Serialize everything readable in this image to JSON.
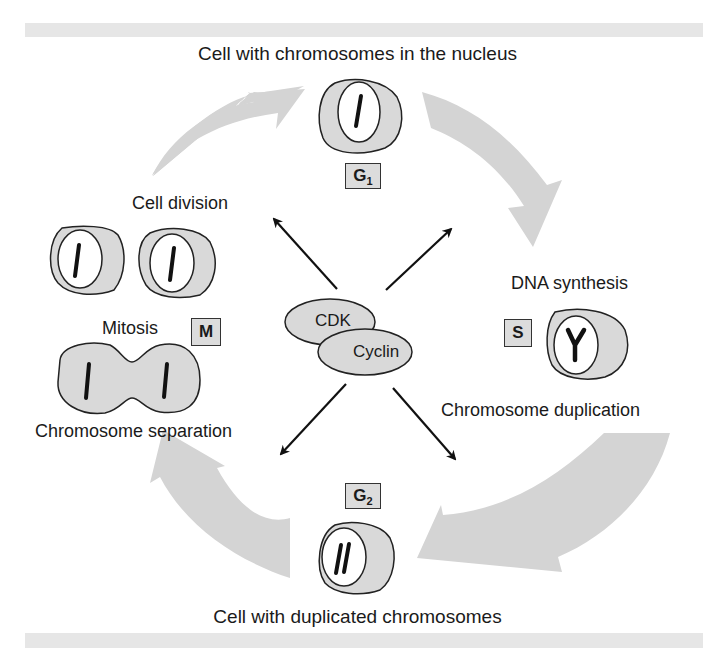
{
  "title": "Cell with chromosomes in the nucleus",
  "footer": "Cell with duplicated chromosomes",
  "labels": {
    "cell_division": "Cell division",
    "mitosis": "Mitosis",
    "chromosome_separation": "Chromosome separation",
    "dna_synthesis": "DNA synthesis",
    "chromosome_duplication": "Chromosome duplication"
  },
  "phases": {
    "g1": {
      "letter": "G",
      "sub": "1"
    },
    "s": {
      "letter": "S",
      "sub": ""
    },
    "g2": {
      "letter": "G",
      "sub": "2"
    },
    "m": {
      "letter": "M",
      "sub": ""
    }
  },
  "center": {
    "cdk": "CDK",
    "cyclin": "Cyclin"
  },
  "colors": {
    "cycle_arrow": "#d4d4d4",
    "cell_fill": "#d9d9d9",
    "nucleus_fill": "#ffffff",
    "band": "#e6e6e6",
    "phase_box": "#dcdcdc"
  }
}
